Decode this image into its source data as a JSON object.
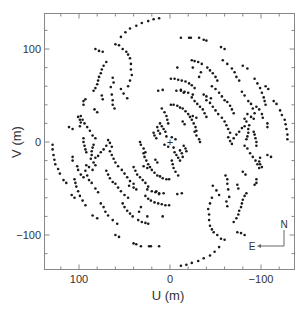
{
  "chart_data": {
    "type": "scatter",
    "title": "",
    "xlabel": "U (m)",
    "ylabel": "V (m)",
    "xlim": [
      138,
      -135
    ],
    "ylim": [
      -138,
      138
    ],
    "x_reversed": true,
    "xticks": [
      {
        "value": 100,
        "label": "100"
      },
      {
        "value": 0,
        "label": "0"
      },
      {
        "value": -100,
        "label": "−100"
      }
    ],
    "yticks": [
      {
        "value": 100,
        "label": "100"
      },
      {
        "value": 0,
        "label": "0"
      },
      {
        "value": -100,
        "label": "−100"
      }
    ],
    "minor_tick_step": 20,
    "grid": false,
    "legend": null,
    "center_marker": {
      "u": 0,
      "v": 0,
      "symbol": "+"
    },
    "compass": {
      "north_label": "N",
      "east_label": "E"
    },
    "symmetry": "point-symmetric: each (u,v) also plotted at (-u,-v)",
    "series": [
      {
        "name": "uv-samples",
        "marker_color": "#1a1a1a",
        "points": [
          [
            54,
            113
          ],
          [
            49,
            118
          ],
          [
            44,
            122
          ],
          [
            37,
            125
          ],
          [
            31,
            128
          ],
          [
            24,
            130
          ],
          [
            18,
            132
          ],
          [
            12,
            133
          ],
          [
            -12,
            112
          ],
          [
            -21,
            112
          ],
          [
            -23,
            112
          ],
          [
            -32,
            112
          ],
          [
            -37,
            110
          ],
          [
            -40,
            109
          ],
          [
            -56,
            102
          ],
          [
            -60,
            100
          ],
          [
            -24,
            88
          ],
          [
            -27,
            87
          ],
          [
            -31,
            86
          ],
          [
            -35,
            84
          ],
          [
            -41,
            80
          ],
          [
            -44,
            77
          ],
          [
            -47,
            74
          ],
          [
            -50,
            70
          ],
          [
            -52,
            66
          ],
          [
            -58,
            88
          ],
          [
            -63,
            84
          ],
          [
            -68,
            79
          ],
          [
            -71,
            75
          ],
          [
            -73,
            70
          ],
          [
            -76,
            66
          ],
          [
            -80,
            82
          ],
          [
            -85,
            79
          ],
          [
            -93,
            68
          ],
          [
            -96,
            63
          ],
          [
            -99,
            58
          ],
          [
            -101,
            53
          ],
          [
            -103,
            48
          ],
          [
            -104,
            44
          ],
          [
            -105,
            40
          ],
          [
            -79,
            54
          ],
          [
            -82,
            50
          ],
          [
            -86,
            44
          ],
          [
            -89,
            41
          ],
          [
            -91,
            36
          ],
          [
            -93,
            31
          ],
          [
            -85,
            30
          ],
          [
            -89,
            27
          ],
          [
            -92,
            25
          ],
          [
            -1,
            68
          ],
          [
            -5,
            68
          ],
          [
            -9,
            67
          ],
          [
            -13,
            66
          ],
          [
            -17,
            65
          ],
          [
            -21,
            63
          ],
          [
            -24,
            61
          ],
          [
            -27,
            58
          ],
          [
            -12,
            56
          ],
          [
            -15,
            53
          ],
          [
            -25,
            80
          ],
          [
            -32,
            70
          ],
          [
            -34,
            75
          ],
          [
            8,
            56
          ],
          [
            13,
            55
          ],
          [
            -8,
            80
          ],
          [
            -1,
            40
          ],
          [
            -4,
            40
          ],
          [
            -8,
            39
          ],
          [
            -11,
            37
          ],
          [
            -14,
            36
          ],
          [
            -17,
            33
          ],
          [
            -20,
            30
          ],
          [
            -22,
            27
          ],
          [
            -24,
            24
          ],
          [
            -26,
            20
          ],
          [
            -28,
            16
          ],
          [
            -29,
            12
          ],
          [
            -27,
            11
          ],
          [
            -29,
            7
          ],
          [
            -32,
            3
          ],
          [
            -33,
            0
          ],
          [
            -40,
            45
          ],
          [
            -44,
            42
          ],
          [
            -47,
            38
          ],
          [
            -50,
            34
          ],
          [
            -53,
            30
          ],
          [
            -57,
            26
          ],
          [
            -60,
            22
          ],
          [
            -62,
            18
          ],
          [
            -64,
            14
          ],
          [
            -66,
            10
          ],
          [
            -64,
            5
          ],
          [
            -66,
            1
          ],
          [
            -68,
            -2
          ],
          [
            -25,
            28
          ],
          [
            -29,
            26
          ],
          [
            -14,
            22
          ],
          [
            -16,
            19
          ],
          [
            9,
            36
          ],
          [
            6,
            32
          ],
          [
            4,
            28
          ],
          [
            3,
            24
          ],
          [
            2,
            20
          ],
          [
            11,
            20
          ],
          [
            9,
            17
          ],
          [
            7,
            14
          ],
          [
            5,
            11
          ],
          [
            14,
            16
          ],
          [
            13,
            12
          ],
          [
            11,
            9
          ],
          [
            18,
            10
          ],
          [
            17,
            7
          ],
          [
            15,
            4
          ],
          [
            4,
            6
          ],
          [
            -2,
            5
          ],
          [
            -6,
            3
          ],
          [
            46,
            94
          ],
          [
            44,
            90
          ],
          [
            43,
            84
          ],
          [
            43,
            78
          ],
          [
            42,
            72
          ],
          [
            44,
            66
          ],
          [
            46,
            60
          ],
          [
            48,
            97
          ],
          [
            52,
            100
          ],
          [
            56,
            104
          ],
          [
            60,
            105
          ],
          [
            47,
            47
          ],
          [
            51,
            52
          ],
          [
            54,
            57
          ],
          [
            70,
            86
          ],
          [
            73,
            82
          ],
          [
            75,
            78
          ],
          [
            76,
            74
          ],
          [
            78,
            70
          ],
          [
            79,
            66
          ],
          [
            80,
            62
          ],
          [
            82,
            58
          ],
          [
            84,
            55
          ],
          [
            74,
            97
          ],
          [
            78,
            98
          ],
          [
            82,
            100
          ],
          [
            65,
            59
          ],
          [
            64,
            51
          ],
          [
            63,
            45
          ],
          [
            63,
            40
          ],
          [
            61,
            36
          ],
          [
            63,
            69
          ],
          [
            62,
            64
          ],
          [
            75,
            50
          ],
          [
            74,
            46
          ],
          [
            93,
            46
          ],
          [
            95,
            44
          ],
          [
            95,
            40
          ],
          [
            98,
            28
          ],
          [
            96,
            24
          ],
          [
            94,
            20
          ],
          [
            91,
            16
          ],
          [
            88,
            12
          ],
          [
            85,
            7
          ],
          [
            82,
            4
          ],
          [
            84,
            -3
          ],
          [
            85,
            -6
          ],
          [
            86,
            -10
          ],
          [
            86,
            -14
          ],
          [
            87,
            -18
          ],
          [
            83,
            35
          ],
          [
            80,
            32
          ],
          [
            95,
            4
          ],
          [
            95,
            0
          ],
          [
            94,
            -4
          ],
          [
            93,
            -8
          ],
          [
            92,
            -11
          ],
          [
            101,
            27
          ],
          [
            99,
            24
          ],
          [
            98,
            21
          ],
          [
            99,
            17
          ],
          [
            111,
            16
          ],
          [
            107,
            14
          ],
          [
            107,
            -16
          ],
          [
            107,
            -20
          ],
          [
            102,
            -26
          ],
          [
            101,
            -30
          ],
          [
            98,
            -35
          ],
          [
            95,
            -38
          ],
          [
            129,
            -3
          ],
          [
            129,
            -8
          ],
          [
            128,
            -14
          ],
          [
            127,
            -19
          ],
          [
            126,
            -24
          ],
          [
            123,
            -29
          ],
          [
            121,
            -34
          ],
          [
            117,
            -41
          ],
          [
            114,
            -44
          ],
          [
            108,
            -57
          ],
          [
            105,
            -60
          ],
          [
            70,
            -31
          ],
          [
            68,
            -35
          ],
          [
            66,
            -39
          ],
          [
            63,
            -43
          ],
          [
            60,
            -45
          ],
          [
            57,
            -49
          ],
          [
            54,
            -53
          ],
          [
            50,
            -57
          ],
          [
            46,
            -60
          ],
          [
            82,
            -25
          ],
          [
            84,
            -22
          ],
          [
            70,
            -4
          ],
          [
            73,
            -8
          ],
          [
            76,
            -11
          ],
          [
            79,
            -15
          ],
          [
            82,
            -17
          ],
          [
            40,
            -27
          ],
          [
            38,
            -31
          ],
          [
            36,
            -35
          ],
          [
            33,
            -38
          ],
          [
            30,
            -41
          ],
          [
            27,
            -44
          ],
          [
            24,
            -48
          ],
          [
            45,
            -47
          ],
          [
            40,
            -49
          ],
          [
            37,
            -51
          ],
          [
            25,
            -51
          ],
          [
            20,
            -53
          ],
          [
            16,
            -54
          ],
          [
            12,
            -55
          ],
          [
            7,
            -55
          ]
        ]
      }
    ]
  }
}
